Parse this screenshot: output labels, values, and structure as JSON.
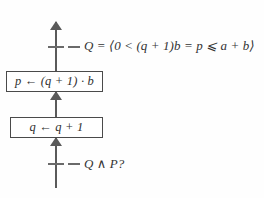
{
  "diagram": {
    "type": "program-flowchart-with-assertions",
    "background_color": "#fefefe",
    "line_color": "#5a5a5a",
    "box_border_color": "#4a4a4a",
    "text_color": "#333333",
    "assertions": [
      {
        "id": "invariant",
        "position": "top",
        "text": "Q = ⟨0 < (q + 1)b = p ⩽ a + b⟩"
      },
      {
        "id": "precondition",
        "position": "bottom",
        "text": "Q ∧ P?"
      }
    ],
    "nodes": [
      {
        "id": "assign-p",
        "position": "upper",
        "text": "p ← (q + 1) · b"
      },
      {
        "id": "increment-q",
        "position": "lower",
        "text": "q ← q + 1"
      }
    ],
    "flow_direction": "bottom-to-top"
  }
}
